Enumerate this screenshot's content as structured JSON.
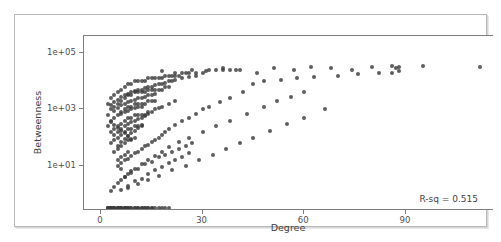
{
  "figure": {
    "background_color": "#ffffff",
    "frame_color": "#b8b8b8",
    "axis_color": "#7d7d7d",
    "point_color": "#3a3a3a"
  },
  "annotation": {
    "rsq_label": "R-sq = 0.515"
  },
  "chart_data": {
    "type": "scatter",
    "title": "",
    "xlabel": "Degree",
    "ylabel": "Betweenness",
    "xlim": [
      -5,
      116
    ],
    "ylim_log10": [
      -0.6,
      5.6
    ],
    "yscale": "log",
    "grid": false,
    "legend": null,
    "xticks": [
      0,
      30,
      60,
      90
    ],
    "xticklabels": [
      "0",
      "30",
      "60",
      "90"
    ],
    "yticks": [
      10,
      1000,
      100000
    ],
    "yticklabels": [
      "1e+01",
      "1e+03",
      "1e+05"
    ],
    "annotations": [
      {
        "text": "R-sq = 0.515",
        "position": "bottom-right"
      }
    ],
    "series": [
      {
        "name": "nodes",
        "marker": "circle",
        "color": "#3a3a3a",
        "size": 4,
        "alpha": 0.82,
        "x": [
          2,
          2,
          2,
          3,
          3,
          3,
          3,
          3,
          4,
          4,
          4,
          4,
          4,
          4,
          5,
          5,
          5,
          5,
          5,
          5,
          5,
          6,
          6,
          6,
          6,
          6,
          6,
          6,
          6,
          7,
          7,
          7,
          7,
          7,
          7,
          7,
          8,
          8,
          8,
          8,
          8,
          8,
          8,
          9,
          9,
          9,
          9,
          9,
          9,
          10,
          10,
          10,
          10,
          10,
          10,
          11,
          11,
          11,
          11,
          11,
          12,
          12,
          12,
          12,
          12,
          13,
          13,
          13,
          13,
          14,
          14,
          14,
          14,
          15,
          15,
          15,
          16,
          16,
          16,
          17,
          17,
          18,
          18,
          19,
          19,
          20,
          20,
          21,
          22,
          23,
          24,
          25,
          26,
          28,
          30,
          32,
          34,
          36,
          38,
          40,
          3,
          3,
          4,
          4,
          4,
          5,
          5,
          5,
          6,
          6,
          6,
          6,
          7,
          7,
          7,
          7,
          8,
          8,
          8,
          8,
          9,
          9,
          9,
          9,
          10,
          10,
          10,
          11,
          11,
          11,
          12,
          12,
          12,
          13,
          13,
          14,
          14,
          15,
          15,
          16,
          16,
          17,
          18,
          19,
          20,
          21,
          22,
          24,
          26,
          28,
          4,
          5,
          5,
          6,
          6,
          7,
          7,
          8,
          8,
          9,
          9,
          10,
          10,
          11,
          11,
          12,
          12,
          13,
          14,
          15,
          16,
          17,
          18,
          20,
          22,
          5,
          6,
          7,
          8,
          9,
          10,
          11,
          12,
          13,
          14,
          15,
          16,
          17,
          18,
          19,
          20,
          22,
          24,
          26,
          28,
          30,
          32,
          35,
          38,
          42,
          6,
          7,
          8,
          9,
          10,
          12,
          14,
          16,
          18,
          20,
          23,
          26,
          30,
          34,
          38,
          43,
          48,
          52,
          56,
          60,
          8,
          11,
          14,
          17,
          21,
          25,
          29,
          33,
          37,
          41,
          45,
          50,
          55,
          60,
          66,
          18,
          22,
          27,
          31,
          36,
          41,
          46,
          51,
          57,
          62,
          68,
          74,
          80,
          86,
          87,
          88,
          95,
          112,
          45,
          48,
          53,
          58,
          63,
          70,
          76,
          82,
          86,
          88,
          2,
          3,
          3,
          4,
          4,
          5,
          5,
          6,
          6,
          7,
          7,
          8,
          8,
          9,
          10,
          11,
          12,
          13,
          14,
          15,
          16,
          17,
          18,
          19,
          20,
          2,
          2,
          3,
          3,
          4,
          4,
          5,
          5,
          6,
          6,
          7,
          7,
          8,
          9,
          10,
          11,
          12,
          13,
          14,
          15,
          3,
          4,
          5,
          6,
          7,
          8,
          9,
          10,
          11,
          12,
          13,
          14,
          15,
          16,
          17,
          18,
          19,
          20,
          21,
          22,
          23,
          24,
          25,
          26,
          27
        ],
        "y_log10": [
          3.2,
          2.8,
          2.4,
          3.4,
          3.0,
          2.6,
          2.2,
          1.8,
          3.5,
          3.1,
          2.7,
          2.3,
          1.9,
          1.5,
          3.6,
          3.2,
          2.8,
          2.4,
          2.0,
          1.6,
          1.2,
          3.7,
          3.3,
          2.9,
          2.5,
          2.1,
          1.7,
          1.3,
          0.9,
          3.8,
          3.4,
          3.0,
          2.6,
          2.2,
          1.8,
          1.4,
          3.9,
          3.5,
          3.1,
          2.7,
          2.3,
          1.9,
          1.5,
          3.9,
          3.5,
          3.1,
          2.7,
          2.3,
          1.9,
          4.0,
          3.6,
          3.2,
          2.8,
          2.4,
          2.0,
          4.0,
          3.6,
          3.2,
          2.8,
          2.4,
          4.0,
          3.6,
          3.2,
          2.8,
          2.4,
          4.0,
          3.6,
          3.2,
          2.8,
          4.1,
          3.7,
          3.3,
          2.9,
          4.1,
          3.7,
          3.3,
          4.1,
          3.7,
          3.3,
          4.1,
          3.7,
          4.1,
          3.7,
          4.2,
          3.8,
          4.2,
          3.8,
          4.2,
          4.2,
          4.2,
          4.3,
          4.3,
          4.3,
          4.3,
          4.3,
          4.4,
          4.4,
          4.4,
          4.4,
          4.4,
          3.15,
          2.55,
          3.25,
          2.95,
          2.45,
          3.35,
          3.05,
          2.35,
          3.45,
          3.15,
          2.85,
          2.25,
          3.5,
          3.2,
          2.9,
          2.15,
          3.55,
          3.25,
          2.95,
          2.05,
          3.6,
          3.3,
          3.0,
          1.95,
          3.65,
          3.35,
          3.05,
          3.7,
          3.4,
          3.1,
          3.7,
          3.4,
          3.1,
          3.75,
          3.45,
          3.8,
          3.5,
          3.8,
          3.5,
          3.85,
          3.55,
          3.9,
          3.9,
          3.95,
          4.0,
          4.0,
          4.05,
          4.1,
          4.15,
          4.2,
          2.1,
          2.2,
          1.7,
          2.3,
          1.85,
          2.4,
          1.95,
          2.5,
          2.05,
          2.55,
          2.15,
          2.6,
          2.25,
          2.65,
          2.35,
          2.7,
          2.45,
          2.75,
          2.85,
          2.9,
          3.0,
          3.05,
          3.1,
          3.2,
          3.3,
          1.0,
          1.1,
          1.2,
          1.25,
          1.35,
          1.45,
          1.5,
          1.6,
          1.7,
          1.75,
          1.85,
          1.9,
          2.0,
          2.1,
          2.2,
          2.3,
          2.45,
          2.6,
          2.7,
          2.85,
          3.0,
          3.1,
          3.25,
          3.4,
          3.6,
          0.5,
          0.6,
          0.7,
          0.8,
          0.9,
          1.05,
          1.2,
          1.35,
          1.5,
          1.65,
          1.85,
          2.0,
          2.2,
          2.4,
          2.6,
          2.85,
          3.1,
          3.3,
          3.45,
          3.6,
          0.2,
          0.35,
          0.5,
          0.65,
          0.85,
          1.0,
          1.2,
          1.4,
          1.6,
          1.8,
          2.0,
          2.25,
          2.5,
          2.7,
          3.0,
          4.35,
          4.3,
          4.4,
          4.35,
          4.45,
          4.4,
          4.3,
          4.45,
          4.4,
          4.5,
          4.45,
          4.4,
          4.5,
          4.55,
          4.45,
          4.5,
          4.55,
          4.5,
          3.9,
          4.0,
          4.05,
          4.1,
          4.15,
          4.2,
          4.25,
          4.3,
          4.3,
          4.35,
          -0.5,
          -0.5,
          -0.5,
          -0.5,
          -0.5,
          -0.5,
          -0.5,
          -0.5,
          -0.5,
          -0.5,
          -0.5,
          -0.5,
          -0.5,
          -0.5,
          -0.5,
          -0.5,
          -0.5,
          -0.5,
          -0.5,
          -0.5,
          -0.5,
          -0.5,
          -0.5,
          -0.5,
          -0.5,
          -0.5,
          -0.5,
          -0.5,
          -0.5,
          -0.5,
          -0.5,
          -0.5,
          -0.5,
          -0.5,
          -0.5,
          -0.5,
          -0.5,
          -0.5,
          -0.5,
          -0.5,
          -0.5,
          -0.5,
          -0.5,
          -0.5,
          -0.5,
          0.1,
          0.25,
          0.4,
          0.15,
          0.6,
          0.3,
          0.75,
          0.45,
          0.9,
          0.55,
          1.05,
          0.7,
          1.15,
          0.85,
          1.3,
          0.95,
          1.4,
          1.1,
          1.5,
          1.2,
          1.6,
          1.3,
          1.7,
          1.45,
          1.8
        ]
      }
    ]
  }
}
